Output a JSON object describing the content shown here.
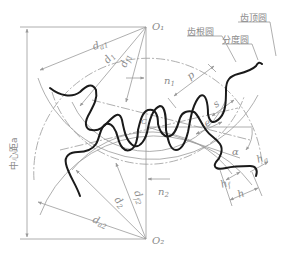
{
  "diagram": {
    "centers": {
      "upper": "O₁",
      "lower": "O₂"
    },
    "pitch_point": "C",
    "center_distance_label": "中心距a",
    "circle_labels": {
      "addendum_circle": "齿顶圆",
      "dedendum_circle": "齿根圆",
      "pitch_circle": "分度圆"
    },
    "dimension_labels": {
      "da1": "d",
      "da1_sub": "a1",
      "d1": "d",
      "d1_sub": "1",
      "df1": "d",
      "df1_sub": "f1",
      "da2": "d",
      "da2_sub": "a2",
      "d2": "d",
      "d2_sub": "2",
      "df2": "d",
      "df2_sub": "f2",
      "n1": "n",
      "n1_sub": "1",
      "n2": "n",
      "n2_sub": "2",
      "p": "p",
      "s": "s",
      "e": "e",
      "alpha": "α",
      "ha": "h",
      "ha_sub": "a",
      "hf": "h",
      "hf_sub": "f",
      "h": "h"
    },
    "colors": {
      "tooth_profile": "#1a1a1a",
      "construction_lines": "#9a9a9a",
      "labels": "#8a8a8a",
      "background": "#ffffff"
    }
  }
}
